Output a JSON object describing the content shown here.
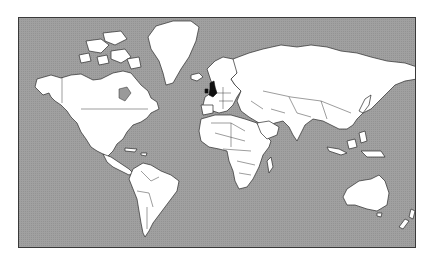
{
  "map": {
    "projection": "mercator",
    "colors": {
      "ocean": "#9c9c9c",
      "land": "#ffffff",
      "highlight": "#111111",
      "frame": "#3a3a3a",
      "background": "#ffffff"
    },
    "highlighted_regions": [
      {
        "name": "United Kingdom"
      }
    ],
    "regions": [
      {
        "name": "North America"
      },
      {
        "name": "Greenland"
      },
      {
        "name": "South America"
      },
      {
        "name": "Europe"
      },
      {
        "name": "Africa"
      },
      {
        "name": "Asia"
      },
      {
        "name": "Australia"
      },
      {
        "name": "New Zealand"
      }
    ]
  }
}
